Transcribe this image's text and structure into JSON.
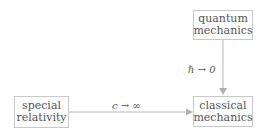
{
  "diagram": {
    "nodes": {
      "quantum": {
        "line1": "quantum",
        "line2": "mechanics"
      },
      "classical": {
        "line1": "classical",
        "line2": "mechanics"
      },
      "special": {
        "line1": "special",
        "line2": "relativity"
      }
    },
    "edges": {
      "quantum_to_classical": {
        "label": "ℏ → 0"
      },
      "special_to_classical": {
        "label": "c → ∞"
      }
    },
    "colors": {
      "border": "#c8c8c8",
      "arrow": "#b0b0b0",
      "text": "#555555"
    }
  }
}
